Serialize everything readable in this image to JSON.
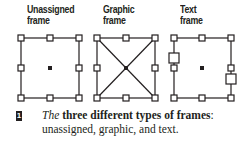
{
  "labels": {
    "unassigned": [
      "Unassigned",
      "frame"
    ],
    "graphic": [
      "Graphic",
      "frame"
    ],
    "text": [
      "Text",
      "frame"
    ]
  },
  "figure_number": "1",
  "caption": {
    "line1_italic": "The",
    "line1_bold": " three different types of frames",
    "line1_end": ":",
    "line2": "unassigned, graphic, and text."
  },
  "colors": {
    "ink": "#231f20"
  }
}
